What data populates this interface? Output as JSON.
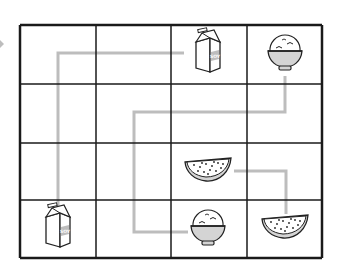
{
  "puzzle": {
    "description": "4x4 grid matching puzzle with connecting paths between identical food items",
    "grid": {
      "rows": 4,
      "cols": 4,
      "x_lines": [
        20,
        96,
        171,
        247,
        322
      ],
      "y_lines": [
        25,
        84,
        143,
        200,
        258
      ],
      "line_color": "#1a1a1a"
    },
    "path_color": "#bdbdbd",
    "items": [
      {
        "type": "milk-carton",
        "row": 0,
        "col": 2,
        "cx": 208,
        "cy": 54,
        "label": "SOY"
      },
      {
        "type": "rice-bowl",
        "row": 0,
        "col": 3,
        "cx": 285,
        "cy": 54
      },
      {
        "type": "watermelon-slice",
        "row": 2,
        "col": 2,
        "cx": 208,
        "cy": 171
      },
      {
        "type": "milk-carton",
        "row": 3,
        "col": 0,
        "cx": 58,
        "cy": 229,
        "label": "SOY"
      },
      {
        "type": "rice-bowl",
        "row": 3,
        "col": 2,
        "cx": 208,
        "cy": 229
      },
      {
        "type": "watermelon-slice",
        "row": 3,
        "col": 3,
        "cx": 285,
        "cy": 228
      }
    ],
    "paths": [
      {
        "name": "milk-path",
        "points": [
          [
            58,
            213
          ],
          [
            58,
            53
          ],
          [
            184,
            53
          ]
        ]
      },
      {
        "name": "rice-path",
        "points": [
          [
            285,
            76
          ],
          [
            285,
            112
          ],
          [
            134,
            112
          ],
          [
            134,
            232
          ],
          [
            188,
            232
          ]
        ]
      },
      {
        "name": "watermelon-path",
        "points": [
          [
            234,
            171
          ],
          [
            286,
            171
          ],
          [
            286,
            214
          ]
        ]
      }
    ]
  }
}
